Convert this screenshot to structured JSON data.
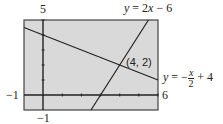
{
  "chart_data": {
    "type": "line",
    "title": "",
    "window": {
      "xmin": -1,
      "xmax": 6,
      "ymin": -1,
      "ymax": 5
    },
    "axis_labels": {
      "ymax": "5",
      "ymin": "−1",
      "xmin": "−1",
      "xmax": "6"
    },
    "series": [
      {
        "name": "y = 2x − 6",
        "slope": 2,
        "intercept": -6
      },
      {
        "name": "y = −x/2 + 4",
        "slope": -0.5,
        "intercept": 4
      }
    ],
    "annotations": [
      {
        "text": "(4, 2)",
        "x": 4,
        "y": 2
      }
    ],
    "ticks": {
      "x": [
        1,
        2,
        3,
        4,
        5,
        6
      ],
      "y": [
        1,
        2,
        3,
        4,
        5
      ]
    },
    "background": "#d9d9d9",
    "line_color": "#222222"
  },
  "labels": {
    "ymax": "5",
    "ymin": "−1",
    "xmin": "−1",
    "xmax": "6",
    "line1_lhs": "y",
    "line1_rhs": " = 2",
    "line1_x": "x",
    "line1_tail": " − 6",
    "line2_lhs": "y",
    "line2_eq": " = −",
    "line2_num": "x",
    "line2_den": "2",
    "line2_tail": " + 4",
    "point": "(4, 2)"
  }
}
